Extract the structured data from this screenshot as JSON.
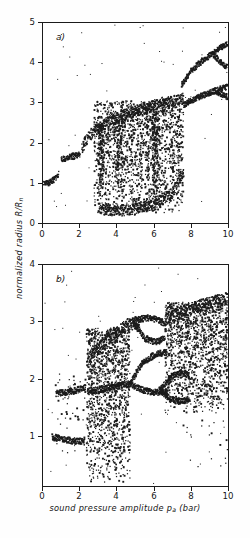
{
  "figure": {
    "xlabel_main": "sound pressure amplitude ",
    "xlabel_sym": "p",
    "xlabel_sub": "a",
    "xlabel_unit": " (bar)",
    "ylabel_main": "normalized radius R/R",
    "ylabel_sub": "n",
    "ink_color": "#1b1b1b",
    "background": "#ffffff"
  },
  "panels": [
    {
      "tag": "a)",
      "name": "panel-a"
    },
    {
      "tag": "b)",
      "name": "panel-b"
    }
  ],
  "axes": {
    "panel_a": {
      "x_ticks": [
        "0",
        "2",
        "4",
        "6",
        "8",
        "10"
      ],
      "y_ticks": [
        "0",
        "1",
        "2",
        "3",
        "4",
        "5"
      ]
    },
    "panel_b": {
      "x_ticks": [
        "0",
        "2",
        "4",
        "6",
        "8",
        "10"
      ],
      "y_ticks": [
        "1",
        "2",
        "3",
        "4"
      ]
    }
  },
  "chart_data": [
    {
      "type": "scatter",
      "id": "panel-a",
      "title": "a)",
      "xlabel": "sound pressure amplitude p_a (bar)",
      "ylabel": "normalized radius R/R_n",
      "xlim": [
        0,
        10
      ],
      "ylim": [
        0,
        5
      ],
      "x_ticks": [
        0,
        2,
        4,
        6,
        8,
        10
      ],
      "y_ticks": [
        0,
        1,
        2,
        3,
        4,
        5
      ],
      "grid": false,
      "legend": null,
      "description": "Bifurcation diagram of normalized bubble radius versus sound pressure amplitude; period-1 branch, period doubling and chaotic bands.",
      "branches": [
        {
          "name": "period-1-low",
          "x": [
            0.0,
            0.3,
            0.6,
            0.85
          ],
          "y": [
            0.97,
            1.0,
            1.08,
            1.22
          ]
        },
        {
          "name": "period-1-mid",
          "x": [
            1.0,
            1.3,
            1.7,
            2.0
          ],
          "y": [
            1.6,
            1.63,
            1.68,
            1.72
          ]
        },
        {
          "name": "rising-branch",
          "x": [
            2.1,
            2.3,
            2.6,
            2.9,
            3.2
          ],
          "y": [
            1.85,
            2.05,
            2.22,
            2.35,
            2.42
          ]
        },
        {
          "name": "chaos-upper-envelope",
          "x": [
            3.2,
            4.0,
            5.0,
            6.0,
            7.0,
            7.6
          ],
          "y": [
            2.45,
            2.62,
            2.78,
            2.95,
            3.05,
            3.12
          ]
        },
        {
          "name": "chaos-lower-envelope",
          "x": [
            3.0,
            4.0,
            5.0,
            6.0,
            7.0,
            7.6
          ],
          "y": [
            0.35,
            0.3,
            0.35,
            0.45,
            0.75,
            1.3
          ]
        },
        {
          "name": "upper-escape-branch",
          "x": [
            7.5,
            8.0,
            8.6,
            9.2,
            10.0
          ],
          "y": [
            3.45,
            3.8,
            4.05,
            4.25,
            4.5
          ]
        },
        {
          "name": "upper-escape-branch-split-lower",
          "x": [
            9.2,
            9.6,
            10.0
          ],
          "y": [
            4.2,
            4.02,
            3.88
          ]
        },
        {
          "name": "lower-escape-branch",
          "x": [
            7.6,
            8.2,
            8.8,
            9.4,
            10.0
          ],
          "y": [
            2.95,
            3.1,
            3.22,
            3.32,
            3.42
          ]
        },
        {
          "name": "lower-escape-branch-split-lower",
          "x": [
            9.4,
            9.7,
            10.0
          ],
          "y": [
            3.28,
            3.2,
            3.14
          ]
        }
      ],
      "chaotic_regions": [
        {
          "x_range": [
            2.75,
            7.6
          ],
          "y_range": [
            0.25,
            3.05
          ],
          "density": "high"
        },
        {
          "x_range": [
            3.0,
            3.3
          ],
          "y_range": [
            0.6,
            2.45
          ],
          "density": "very-high"
        },
        {
          "x_range": [
            4.0,
            4.3
          ],
          "y_range": [
            0.6,
            2.5
          ],
          "density": "very-high"
        },
        {
          "x_range": [
            5.9,
            6.3
          ],
          "y_range": [
            0.6,
            2.8
          ],
          "density": "very-high"
        }
      ]
    },
    {
      "type": "scatter",
      "id": "panel-b",
      "title": "b)",
      "xlabel": "sound pressure amplitude p_a (bar)",
      "ylabel": "normalized radius R/R_n",
      "xlim": [
        0,
        10
      ],
      "ylim": [
        0.15,
        4.0
      ],
      "x_ticks": [
        0,
        2,
        4,
        6,
        8,
        10
      ],
      "y_ticks": [
        1,
        2,
        3,
        4
      ],
      "grid": false,
      "legend": null,
      "description": "Bifurcation diagram with coexisting period-1 branches near R/Rn = 1 and 1.8, period-doubling bubbles and wide chaotic bands.",
      "branches": [
        {
          "name": "lower-period-1",
          "x": [
            0.5,
            1.0,
            1.5,
            2.0,
            2.25
          ],
          "y": [
            1.0,
            0.97,
            0.94,
            0.93,
            0.92
          ]
        },
        {
          "name": "upper-period-1",
          "x": [
            0.7,
            1.2,
            1.7,
            2.1,
            2.3
          ],
          "y": [
            1.76,
            1.78,
            1.81,
            1.84,
            1.88
          ]
        },
        {
          "name": "mid-branch-continuation",
          "x": [
            2.4,
            3.0,
            3.6,
            4.2,
            4.7
          ],
          "y": [
            1.8,
            1.82,
            1.86,
            1.9,
            1.93
          ]
        },
        {
          "name": "upper-rising-envelope",
          "x": [
            2.4,
            3.2,
            4.0,
            4.6,
            5.2
          ],
          "y": [
            2.35,
            2.62,
            2.85,
            2.96,
            3.0
          ]
        },
        {
          "name": "period-2-bubble-upper",
          "x": [
            4.9,
            5.5,
            6.1,
            6.6
          ],
          "y": [
            3.0,
            3.08,
            3.05,
            2.98
          ]
        },
        {
          "name": "period-2-bubble-lower",
          "x": [
            4.9,
            5.5,
            6.1,
            6.6
          ],
          "y": [
            3.0,
            2.72,
            2.66,
            2.72
          ]
        },
        {
          "name": "period-2-bubble-2-upper",
          "x": [
            4.7,
            5.4,
            6.1,
            6.7
          ],
          "y": [
            1.93,
            2.3,
            2.45,
            2.48
          ]
        },
        {
          "name": "period-2-bubble-2-lower",
          "x": [
            4.7,
            5.4,
            6.1,
            6.7
          ],
          "y": [
            1.93,
            1.82,
            1.78,
            1.8
          ]
        },
        {
          "name": "period-2-bubble-3-upper",
          "x": [
            6.3,
            6.9,
            7.4,
            7.9
          ],
          "y": [
            1.82,
            2.05,
            2.12,
            2.08
          ]
        },
        {
          "name": "period-2-bubble-3-lower",
          "x": [
            6.3,
            6.9,
            7.4,
            7.9
          ],
          "y": [
            1.82,
            1.66,
            1.62,
            1.66
          ]
        },
        {
          "name": "top-envelope-right",
          "x": [
            6.6,
            7.6,
            8.6,
            9.4,
            10.0
          ],
          "y": [
            3.05,
            3.2,
            3.3,
            3.37,
            3.42
          ]
        }
      ],
      "chaotic_regions": [
        {
          "x_range": [
            2.35,
            4.7
          ],
          "y_range": [
            0.2,
            2.9
          ],
          "density": "very-high"
        },
        {
          "x_range": [
            6.6,
            10.0
          ],
          "y_range": [
            1.4,
            3.35
          ],
          "density": "very-high"
        },
        {
          "x_range": [
            0.6,
            2.3
          ],
          "y_range": [
            0.7,
            2.1
          ],
          "density": "low"
        },
        {
          "x_range": [
            7.5,
            10.0
          ],
          "y_range": [
            0.3,
            1.3
          ],
          "density": "very-low"
        }
      ]
    }
  ]
}
